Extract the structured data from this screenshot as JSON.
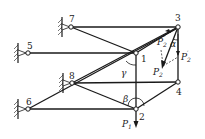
{
  "diagram": {
    "type": "space truss statics diagram",
    "nodes": [
      {
        "id": "7",
        "label": "7",
        "x": 71,
        "y": 27,
        "support": true
      },
      {
        "id": "3",
        "label": "3",
        "x": 178,
        "y": 27,
        "support": false
      },
      {
        "id": "5",
        "label": "5",
        "x": 28,
        "y": 53,
        "support": true
      },
      {
        "id": "1",
        "label": "1",
        "x": 136,
        "y": 53,
        "support": false
      },
      {
        "id": "8",
        "label": "8",
        "x": 72,
        "y": 83,
        "support": true
      },
      {
        "id": "4",
        "label": "4",
        "x": 178,
        "y": 82,
        "support": false
      },
      {
        "id": "6",
        "label": "6",
        "x": 28,
        "y": 109,
        "support": true
      },
      {
        "id": "2",
        "label": "2",
        "x": 136,
        "y": 109,
        "support": false
      }
    ],
    "members": [
      [
        "7",
        "3"
      ],
      [
        "7",
        "1"
      ],
      [
        "5",
        "1"
      ],
      [
        "3",
        "1"
      ],
      [
        "3",
        "8"
      ],
      [
        "1",
        "2"
      ],
      [
        "8",
        "4"
      ],
      [
        "8",
        "2"
      ],
      [
        "6",
        "2"
      ],
      [
        "6",
        "3"
      ],
      [
        "3",
        "4"
      ],
      [
        "4",
        "2"
      ]
    ],
    "forces": {
      "P1": {
        "label": "P",
        "sub": "1"
      },
      "P2": {
        "label": "P",
        "sub": "2"
      },
      "P2_prime": {
        "label": "P",
        "sub": "2",
        "sup": "′"
      },
      "P2_double_prime": {
        "label": "P",
        "sub": "2",
        "sup": "″"
      }
    },
    "angles": {
      "alpha": "α",
      "beta": "β",
      "gamma": "γ"
    }
  }
}
